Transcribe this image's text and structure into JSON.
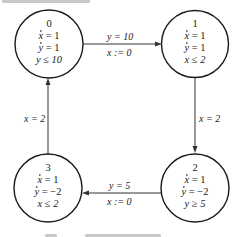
{
  "diagram": {
    "type": "hybrid-automaton",
    "states": [
      {
        "id": "0",
        "flow_x": "= 1",
        "flow_y": "= 1",
        "invariant": "y ≤ 10"
      },
      {
        "id": "1",
        "flow_x": "= 1",
        "flow_y": "= 1",
        "invariant": "x ≤ 2"
      },
      {
        "id": "2",
        "flow_x": "= 1",
        "flow_y": "= −2",
        "invariant": "y ≥ 5"
      },
      {
        "id": "3",
        "flow_x": "= 1",
        "flow_y": "= −2",
        "invariant": "x ≤ 2"
      }
    ],
    "transitions": [
      {
        "from": "0",
        "to": "1",
        "guard": "y = 10",
        "reset": "x := 0"
      },
      {
        "from": "1",
        "to": "2",
        "guard": "x = 2",
        "reset": ""
      },
      {
        "from": "2",
        "to": "3",
        "guard": "y = 5",
        "reset": "x := 0"
      },
      {
        "from": "3",
        "to": "0",
        "guard": "x = 2",
        "reset": ""
      }
    ],
    "var_x": "x",
    "var_y": "y"
  }
}
